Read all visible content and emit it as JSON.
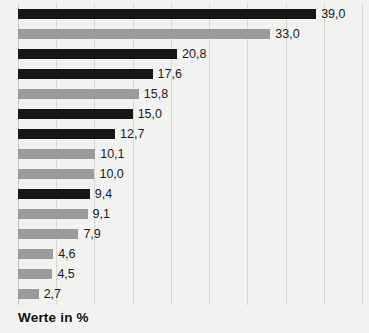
{
  "caption": "Werte in %",
  "colors": {
    "background": "#f2f2f0",
    "bar_dark": "#171717",
    "bar_light": "#9b9b9b",
    "gridline": "#d7d7d4",
    "label_text": "#1b1b1b"
  },
  "chart_data": {
    "type": "bar",
    "orientation": "horizontal",
    "title": "",
    "subtitle": "",
    "xlabel": "Werte in %",
    "ylabel": "",
    "xlim": [
      0,
      45
    ],
    "grid": true,
    "grid_axis": "x",
    "gridline_values": [
      0,
      5,
      10,
      15,
      20,
      25,
      30,
      35,
      40,
      45
    ],
    "legend": null,
    "legend_position": "none",
    "categories": [
      "",
      "",
      "",
      "",
      "",
      "",
      "",
      "",
      "",
      "",
      "",
      "",
      "",
      "",
      ""
    ],
    "values": [
      39.0,
      33.0,
      20.8,
      17.6,
      15.8,
      15.0,
      12.7,
      10.1,
      10.0,
      9.4,
      9.1,
      7.9,
      4.6,
      4.5,
      2.7
    ],
    "value_labels": [
      "39,0",
      "33,0",
      "20,8",
      "17,6",
      "15,8",
      "15,0",
      "12,7",
      "10,1",
      "10,0",
      "9,4",
      "9,1",
      "7,9",
      "4,6",
      "4,5",
      "2,7"
    ],
    "bar_colors": [
      "dark",
      "light",
      "dark",
      "dark",
      "light",
      "dark",
      "dark",
      "light",
      "light",
      "dark",
      "light",
      "light",
      "light",
      "light",
      "light"
    ],
    "bars": [
      {
        "value": 39.0,
        "label": "39,0",
        "color": "dark"
      },
      {
        "value": 33.0,
        "label": "33,0",
        "color": "light"
      },
      {
        "value": 20.8,
        "label": "20,8",
        "color": "dark"
      },
      {
        "value": 17.6,
        "label": "17,6",
        "color": "dark"
      },
      {
        "value": 15.8,
        "label": "15,8",
        "color": "light"
      },
      {
        "value": 15.0,
        "label": "15,0",
        "color": "dark"
      },
      {
        "value": 12.7,
        "label": "12,7",
        "color": "dark"
      },
      {
        "value": 10.1,
        "label": "10,1",
        "color": "light"
      },
      {
        "value": 10.0,
        "label": "10,0",
        "color": "light"
      },
      {
        "value": 9.4,
        "label": "9,4",
        "color": "dark"
      },
      {
        "value": 9.1,
        "label": "9,1",
        "color": "light"
      },
      {
        "value": 7.9,
        "label": "7,9",
        "color": "light"
      },
      {
        "value": 4.6,
        "label": "4,6",
        "color": "light"
      },
      {
        "value": 4.5,
        "label": "4,5",
        "color": "light"
      },
      {
        "value": 2.7,
        "label": "2,7",
        "color": "light"
      }
    ]
  }
}
